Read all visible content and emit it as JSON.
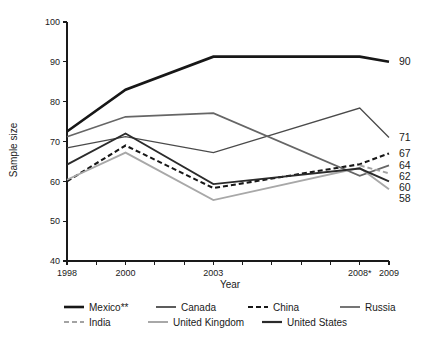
{
  "chart_data": {
    "type": "line",
    "title": "",
    "xlabel": "Year",
    "ylabel": "Sample size",
    "xlim": [
      1998,
      2009
    ],
    "ylim": [
      40,
      100
    ],
    "yticks": [
      40,
      50,
      60,
      70,
      80,
      90,
      100
    ],
    "ytick_labels": [
      "40",
      "50",
      "60",
      "70",
      "80",
      "90",
      "100"
    ],
    "xticks": [
      1998,
      1999,
      2000,
      2001,
      2002,
      2003,
      2004,
      2005,
      2006,
      2007,
      2008,
      2009
    ],
    "xtick_labels": [
      "1998",
      "",
      "2000",
      "",
      "",
      "2003",
      "",
      "",
      "",
      "",
      "2008*",
      "2009"
    ],
    "grid": false,
    "legend_position": "bottom",
    "series": [
      {
        "name": "Mexico**",
        "color": "#171717",
        "width": 2.6,
        "dash": "none",
        "x": [
          1998,
          2000,
          2003,
          2008,
          2009
        ],
        "values": [
          72.5,
          83,
          91.3,
          91.3,
          90
        ],
        "end_label": "90"
      },
      {
        "name": "Canada",
        "color": "#4a4a4a",
        "width": 1.3,
        "dash": "none",
        "x": [
          1998,
          2000,
          2003,
          2008,
          2009
        ],
        "values": [
          68.4,
          71.2,
          67.2,
          78.4,
          71
        ],
        "end_label": "71"
      },
      {
        "name": "China",
        "color": "#171717",
        "width": 2.1,
        "dash": "5,3",
        "x": [
          1998,
          2000,
          2003,
          2008,
          2009
        ],
        "values": [
          60,
          69,
          58.3,
          64.3,
          67
        ],
        "end_label": "67"
      },
      {
        "name": "Russia",
        "color": "#666666",
        "width": 1.7,
        "dash": "none",
        "x": [
          1998,
          2000,
          2003,
          2008,
          2009
        ],
        "values": [
          71.2,
          76.2,
          77.1,
          61.4,
          64
        ],
        "end_label": "64"
      },
      {
        "name": "India",
        "color": "#a3a3a3",
        "width": 1.9,
        "dash": "5,3",
        "x": [
          2008,
          2009
        ],
        "values": [
          64,
          62
        ],
        "end_label": "62"
      },
      {
        "name": "United Kingdom",
        "color": "#a8a8a8",
        "width": 1.9,
        "dash": "none",
        "x": [
          1998,
          2000,
          2003,
          2008,
          2009
        ],
        "values": [
          60.4,
          67.2,
          55.3,
          63.4,
          58
        ],
        "end_label": "58"
      },
      {
        "name": "United States",
        "color": "#2b2b2b",
        "width": 1.9,
        "dash": "none",
        "x": [
          1998,
          2000,
          2003,
          2008,
          2009
        ],
        "values": [
          64.2,
          72,
          59.3,
          63.2,
          60
        ],
        "end_label": "60"
      }
    ],
    "end_labels": [
      {
        "text": "90",
        "value": 90
      },
      {
        "text": "71",
        "value": 71
      },
      {
        "text": "67",
        "value": 67
      },
      {
        "text": "64",
        "value": 64
      },
      {
        "text": "62",
        "value": 62
      },
      {
        "text": "60",
        "value": 60
      },
      {
        "text": "58",
        "value": 58
      }
    ],
    "legend": [
      {
        "label": "Mexico**",
        "color": "#171717",
        "width": 2.6,
        "dash": "none",
        "row": 0,
        "col": 0
      },
      {
        "label": "Canada",
        "color": "#4a4a4a",
        "width": 1.8,
        "dash": "none",
        "row": 0,
        "col": 1
      },
      {
        "label": "China",
        "color": "#171717",
        "width": 2.2,
        "dash": "5,3",
        "row": 0,
        "col": 2
      },
      {
        "label": "Russia",
        "color": "#666666",
        "width": 1.8,
        "dash": "none",
        "row": 0,
        "col": 3
      },
      {
        "label": "India",
        "color": "#a3a3a3",
        "width": 2.0,
        "dash": "5,3",
        "row": 1,
        "col": 0
      },
      {
        "label": "United Kingdom",
        "color": "#a8a8a8",
        "width": 2.0,
        "dash": "none",
        "row": 1,
        "col": 1
      },
      {
        "label": "United States",
        "color": "#2b2b2b",
        "width": 2.2,
        "dash": "none",
        "row": 1,
        "col": 2
      }
    ]
  }
}
